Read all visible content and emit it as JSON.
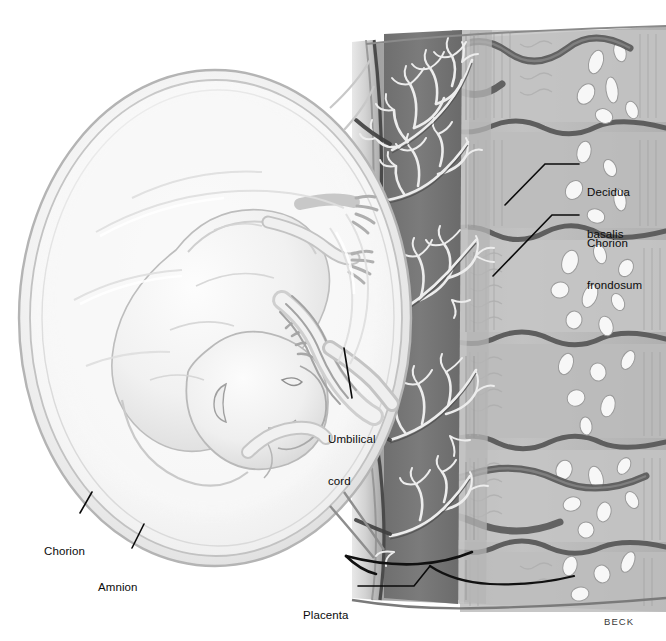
{
  "figure": {
    "signature": "BECK",
    "background_color": "#ffffff",
    "ink_color": "#0b0b0b"
  },
  "labels": [
    {
      "id": "decidua-basalis",
      "text": "Decidua\nbasalis",
      "line1": "Decidua",
      "line2": "basalis",
      "x": 587,
      "y": 157,
      "leader": {
        "x1": 579,
        "y1": 164,
        "x2": 545,
        "y2": 164,
        "x3": 505,
        "y3": 205
      }
    },
    {
      "id": "chorion-frondosum",
      "text": "Chorion\nfrondosum",
      "line1": "Chorion",
      "line2": "frondosum",
      "x": 587,
      "y": 208,
      "leader": {
        "x1": 579,
        "y1": 215,
        "x2": 552,
        "y2": 215,
        "x3": 493,
        "y3": 276
      }
    },
    {
      "id": "umbilical-cord",
      "text": "Umbilical\ncord",
      "line1": "Umbilical",
      "line2": "cord",
      "x": 328,
      "y": 404,
      "leader": {
        "x1": 352,
        "y1": 398,
        "x2": 352,
        "y2": 398,
        "x3": 344,
        "y3": 348
      }
    },
    {
      "id": "chorion",
      "text": "Chorion",
      "line1": "Chorion",
      "line2": "",
      "x": 44,
      "y": 516,
      "leader": {
        "x1": 80,
        "y1": 513,
        "x2": 80,
        "y2": 513,
        "x3": 92,
        "y3": 492
      }
    },
    {
      "id": "amnion",
      "text": "Amnion",
      "line1": "Amnion",
      "line2": "",
      "x": 98,
      "y": 552,
      "leader": {
        "x1": 132,
        "y1": 548,
        "x2": 132,
        "y2": 548,
        "x3": 144,
        "y3": 524
      }
    },
    {
      "id": "placenta",
      "text": "Placenta",
      "line1": "Placenta",
      "line2": "",
      "x": 303,
      "y": 580,
      "leader": {
        "x1": 358,
        "y1": 586,
        "x2": 414,
        "y2": 586,
        "x3": 430,
        "y3": 566
      }
    }
  ],
  "anatomy": {
    "structures": [
      "amniotic sac",
      "chorion",
      "amnion",
      "fetus",
      "umbilical cord",
      "placenta",
      "chorionic villi",
      "intervillous space",
      "decidua basalis",
      "myometrium",
      "uterine vessels"
    ],
    "tones": {
      "sac_light": "#f4f4f4",
      "sac_mid": "#e2e2e2",
      "fetus_light": "#f0f0f0",
      "intervillous_dark": "#6b6b6b",
      "decidua_mid": "#a9a9a9",
      "myometrium_light": "#c6c6c6",
      "septa_dark": "#5e5e5e",
      "vessel_white": "#f6f6f6"
    }
  }
}
